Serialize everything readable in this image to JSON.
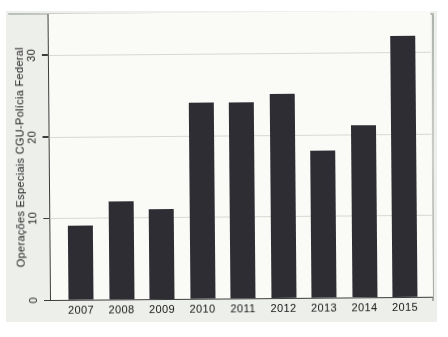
{
  "chart_data": {
    "type": "bar",
    "categories": [
      "2007",
      "2008",
      "2009",
      "2010",
      "2011",
      "2012",
      "2013",
      "2014",
      "2015"
    ],
    "values": [
      9,
      12,
      11,
      24,
      24,
      25,
      18,
      21,
      32
    ],
    "title": "",
    "xlabel": "",
    "ylabel": "Operações Especiais CGU-Polícia Federal",
    "ylim": [
      0,
      35
    ],
    "yticks": [
      0,
      10,
      20,
      30
    ],
    "grid": true,
    "legend": "none",
    "bar_color": "#2d2d33",
    "plot_background": "#fafaf7",
    "scan_background": "#edefeb",
    "axis_color": "#3c3c3c",
    "gridline_color": "#d7d9d2"
  }
}
